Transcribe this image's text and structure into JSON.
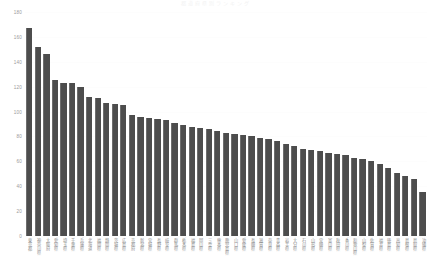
{
  "chart_data": {
    "type": "bar",
    "title": "都道府県別ランキング",
    "xlabel": "",
    "ylabel": "",
    "ylim": [
      0,
      180
    ],
    "ytick_labels": [
      "180",
      "160",
      "140",
      "120",
      "100",
      "80",
      "60",
      "40",
      "20",
      "0"
    ],
    "ytick_values": [
      180,
      160,
      140,
      120,
      100,
      80,
      60,
      40,
      20,
      0
    ],
    "grid": false,
    "legend": "none",
    "bar_color": "#4d4d4d",
    "categories": [
      "東京都",
      "神奈川県",
      "大阪府",
      "愛知県",
      "埼玉県",
      "千葉県",
      "兵庫県",
      "北海道",
      "福岡県",
      "静岡県",
      "茨城県",
      "広島県",
      "京都府",
      "新潟県",
      "宮城県",
      "長野県",
      "岐阜県",
      "群馬県",
      "栃木県",
      "福島県",
      "岡山県",
      "三重県",
      "熊本県",
      "鹿児島県",
      "山口県",
      "愛媛県",
      "長崎県",
      "滋賀県",
      "奈良県",
      "青森県",
      "岩手県",
      "大分県",
      "石川県",
      "山形県",
      "宮崎県",
      "富山県",
      "秋田県",
      "香川県",
      "和歌山県",
      "山梨県",
      "佐賀県",
      "福井県",
      "徳島県",
      "高知県",
      "島根県",
      "鳥取県",
      "沖縄県"
    ],
    "values": [
      167,
      152,
      146,
      125,
      123,
      123,
      120,
      112,
      111,
      107,
      106,
      105,
      97,
      96,
      95,
      94,
      93,
      91,
      89,
      88,
      87,
      86,
      84,
      83,
      82,
      81,
      80,
      79,
      78,
      76,
      74,
      72,
      70,
      69,
      68,
      67,
      66,
      65,
      63,
      62,
      60,
      58,
      55,
      51,
      48,
      46,
      35
    ]
  }
}
